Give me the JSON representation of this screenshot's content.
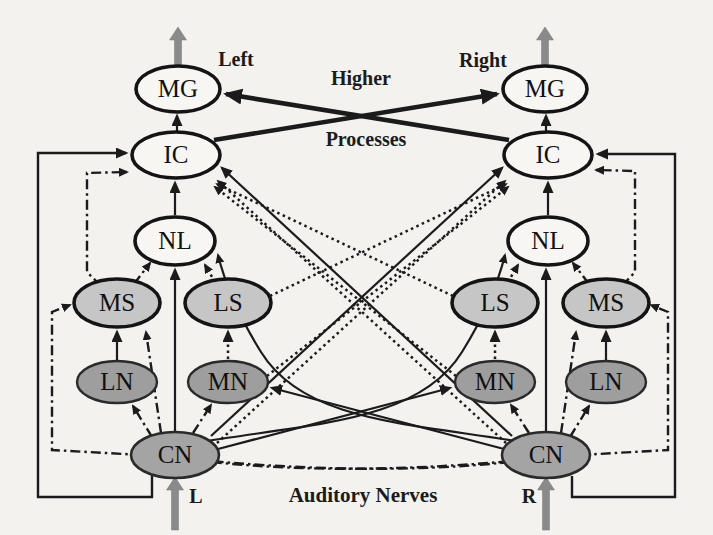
{
  "diagram": {
    "labels": {
      "left": "Left",
      "right": "Right",
      "higher": "Higher",
      "processes": "Processes",
      "auditory_nerves": "Auditory Nerves",
      "l": "L",
      "r": "R"
    },
    "node_labels": {
      "mg": "MG",
      "ic": "IC",
      "nl": "NL",
      "ms": "MS",
      "ls": "LS",
      "ln": "LN",
      "mn": "MN",
      "cn": "CN"
    },
    "colors": {
      "background": "#f3f2ee",
      "upper_node_fill": "#f7f6f3",
      "superior_olive_fill": "#c6c6c6",
      "nucleus_fill": "#9e9e9e",
      "cn_fill": "#a4a4a4",
      "line": "#1b1b1b",
      "io_arrow_gray": "#8a8a8a"
    },
    "connections": [
      {
        "from": "auditory-nerve-L",
        "to": "CN-L",
        "style": "gray-arrow"
      },
      {
        "from": "auditory-nerve-R",
        "to": "CN-R",
        "style": "gray-arrow"
      },
      {
        "from": "MG-L",
        "to": "higher-processes",
        "style": "gray-arrow"
      },
      {
        "from": "MG-R",
        "to": "higher-processes",
        "style": "gray-arrow"
      },
      {
        "from": "CN-L",
        "to": "NL-L",
        "style": "solid"
      },
      {
        "from": "CN-R",
        "to": "NL-R",
        "style": "solid"
      },
      {
        "from": "NL-L",
        "to": "IC-L",
        "style": "solid"
      },
      {
        "from": "NL-R",
        "to": "IC-R",
        "style": "solid"
      },
      {
        "from": "IC-L",
        "to": "MG-L",
        "style": "solid"
      },
      {
        "from": "IC-R",
        "to": "MG-R",
        "style": "solid"
      },
      {
        "from": "IC-L",
        "to": "MG-R",
        "style": "thick-solid"
      },
      {
        "from": "IC-R",
        "to": "MG-L",
        "style": "thick-solid"
      },
      {
        "from": "LN-L",
        "to": "MS-L",
        "style": "solid"
      },
      {
        "from": "LN-R",
        "to": "MS-R",
        "style": "solid"
      },
      {
        "from": "MN-L",
        "to": "LS-L",
        "style": "dotted"
      },
      {
        "from": "MN-R",
        "to": "LS-R",
        "style": "dotted"
      },
      {
        "from": "MS-L",
        "to": "NL-L",
        "style": "dashdot"
      },
      {
        "from": "MS-R",
        "to": "NL-R",
        "style": "dashdot"
      },
      {
        "from": "LS-L",
        "to": "NL-L",
        "style": "dotted"
      },
      {
        "from": "LS-R",
        "to": "NL-R",
        "style": "dotted"
      },
      {
        "from": "CN-L",
        "to": "LN-L",
        "style": "dashdot"
      },
      {
        "from": "CN-R",
        "to": "LN-R",
        "style": "dashdot"
      },
      {
        "from": "CN-L",
        "to": "MN-L",
        "style": "dashdot"
      },
      {
        "from": "CN-R",
        "to": "MN-R",
        "style": "dashdot"
      },
      {
        "from": "CN-L",
        "to": "MS-L",
        "style": "dashdot"
      },
      {
        "from": "CN-R",
        "to": "MS-R",
        "style": "dashdot"
      },
      {
        "from": "CN-L",
        "to": "IC-L",
        "style": "solid-outer-loop"
      },
      {
        "from": "CN-R",
        "to": "IC-R",
        "style": "solid-outer-loop"
      },
      {
        "from": "MS-L",
        "to": "IC-L",
        "style": "dashdot-loop"
      },
      {
        "from": "MS-R",
        "to": "IC-R",
        "style": "dashdot-loop"
      },
      {
        "from": "CN-L",
        "to": "MS-R",
        "style": "dashdot-bottom-loop"
      },
      {
        "from": "CN-R",
        "to": "MS-L",
        "style": "dashdot-bottom-loop"
      },
      {
        "from": "CN-L",
        "to": "IC-R",
        "style": "solid"
      },
      {
        "from": "CN-R",
        "to": "IC-L",
        "style": "solid"
      },
      {
        "from": "CN-L",
        "to": "IC-R",
        "style": "dotted"
      },
      {
        "from": "CN-R",
        "to": "IC-L",
        "style": "dotted"
      },
      {
        "from": "LS-L",
        "to": "IC-R",
        "style": "dotted"
      },
      {
        "from": "LS-R",
        "to": "IC-L",
        "style": "dotted"
      },
      {
        "from": "MN-L",
        "to": "IC-R",
        "style": "dotted"
      },
      {
        "from": "MN-R",
        "to": "IC-L",
        "style": "dotted"
      },
      {
        "from": "CN-L",
        "to": "MN-R",
        "style": "solid"
      },
      {
        "from": "CN-R",
        "to": "MN-L",
        "style": "solid"
      },
      {
        "from": "CN-L",
        "to": "NL-R",
        "style": "solid-curve"
      },
      {
        "from": "CN-R",
        "to": "NL-L",
        "style": "solid-curve"
      }
    ]
  }
}
